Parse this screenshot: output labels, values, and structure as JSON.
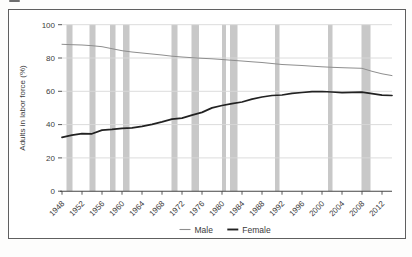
{
  "figure": {
    "border_color": "#5f5f5f",
    "background": "#ffffff"
  },
  "legend": {
    "items": [
      {
        "label": "Male"
      },
      {
        "label": "Female"
      }
    ]
  },
  "chart_data": {
    "type": "line",
    "title": "",
    "xlabel": "",
    "ylabel": "Adults in labor force (%)",
    "ylim": [
      0,
      100
    ],
    "xlim": [
      1947,
      2014
    ],
    "grid": true,
    "legend_position": "bottom-center",
    "y_ticks": [
      0,
      20,
      40,
      60,
      80,
      100
    ],
    "x_ticks": [
      1948,
      1952,
      1956,
      1960,
      1964,
      1968,
      1972,
      1976,
      1980,
      1984,
      1988,
      1992,
      1996,
      2000,
      2004,
      2008,
      2012
    ],
    "band_color": "#c8c8c8",
    "grid_color": "#d8d8d8",
    "axis_color": "#454545",
    "text_color": "#3d3d3d",
    "x": [
      1948,
      1950,
      1952,
      1954,
      1956,
      1958,
      1960,
      1962,
      1964,
      1966,
      1968,
      1970,
      1972,
      1974,
      1976,
      1978,
      1980,
      1982,
      1984,
      1986,
      1988,
      1990,
      1992,
      1994,
      1996,
      1998,
      2000,
      2002,
      2004,
      2006,
      2008,
      2010,
      2012,
      2014
    ],
    "series": [
      {
        "name": "Male",
        "color": "#8e8e8e",
        "line_width": 1.0,
        "values": [
          88.2,
          88.0,
          87.8,
          87.4,
          86.8,
          85.6,
          84.4,
          83.6,
          83.0,
          82.4,
          81.8,
          81.1,
          80.6,
          80.2,
          79.8,
          79.5,
          79.1,
          78.6,
          78.2,
          77.7,
          77.3,
          76.7,
          76.1,
          75.8,
          75.5,
          75.1,
          74.7,
          74.4,
          74.2,
          74.0,
          73.8,
          72.0,
          70.5,
          69.4
        ]
      },
      {
        "name": "Female",
        "color": "#222222",
        "line_width": 1.7,
        "values": [
          32.3,
          33.7,
          34.6,
          34.5,
          36.7,
          37.1,
          37.8,
          38.0,
          38.9,
          40.1,
          41.6,
          43.3,
          43.9,
          45.7,
          47.3,
          50.0,
          51.5,
          52.6,
          53.6,
          55.3,
          56.6,
          57.5,
          57.8,
          58.8,
          59.3,
          59.8,
          59.9,
          59.6,
          59.2,
          59.4,
          59.5,
          58.6,
          57.7,
          57.5
        ]
      }
    ],
    "recession_bands": [
      [
        1948.9,
        1949.9
      ],
      [
        1953.5,
        1954.5
      ],
      [
        1957.6,
        1958.5
      ],
      [
        1960.2,
        1961.3
      ],
      [
        1969.9,
        1970.9
      ],
      [
        1973.9,
        1975.2
      ],
      [
        1980.0,
        1980.6
      ],
      [
        1981.6,
        1982.9
      ],
      [
        1990.6,
        1991.3
      ],
      [
        2001.2,
        2001.9
      ],
      [
        2007.9,
        2009.5
      ]
    ]
  }
}
